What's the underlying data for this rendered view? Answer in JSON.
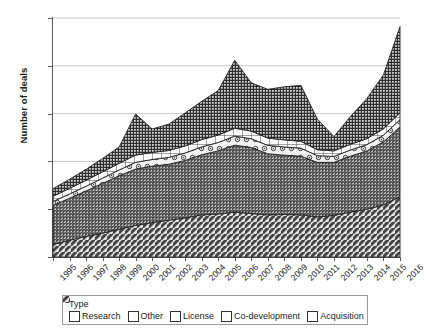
{
  "chart_data": {
    "type": "area",
    "stacked": true,
    "title": "",
    "xlabel": "",
    "ylabel": "Number of deals",
    "ylim": [
      0,
      2500
    ],
    "ytick_labels": [
      "0",
      "500",
      "1000",
      "1500",
      "2000",
      "2500"
    ],
    "ytick_values": [
      0,
      500,
      1000,
      1500,
      2000,
      2500
    ],
    "grid": true,
    "legend_title": "Type",
    "legend_position": "bottom",
    "categories": [
      "1995",
      "1996",
      "1997",
      "1998",
      "1999",
      "2000",
      "2001",
      "2002",
      "2003",
      "2004",
      "2005",
      "2006",
      "2007",
      "2008",
      "2009",
      "2010",
      "2011",
      "2012",
      "2013",
      "2014",
      "2015",
      "2016"
    ],
    "stack_order_bottom_to_top": [
      "Acquisition",
      "License",
      "Co-development",
      "Other",
      "Research"
    ],
    "series": [
      {
        "name": "Acquisition",
        "pattern": "diagonal-hatch-coarse",
        "values": [
          130,
          175,
          215,
          250,
          290,
          330,
          360,
          385,
          410,
          440,
          450,
          470,
          455,
          440,
          445,
          440,
          420,
          435,
          470,
          500,
          545,
          630
        ]
      },
      {
        "name": "License",
        "pattern": "diagonal-hatch-dense",
        "values": [
          410,
          440,
          475,
          520,
          560,
          590,
          590,
          585,
          600,
          630,
          660,
          700,
          690,
          640,
          620,
          615,
          570,
          555,
          585,
          610,
          660,
          730
        ]
      },
      {
        "name": "Co-development",
        "pattern": "circle-dots",
        "values": [
          40,
          45,
          50,
          55,
          60,
          70,
          70,
          72,
          78,
          82,
          88,
          95,
          92,
          88,
          86,
          84,
          70,
          62,
          64,
          66,
          70,
          78
        ]
      },
      {
        "name": "Other",
        "pattern": "open-grid",
        "values": [
          55,
          58,
          62,
          66,
          70,
          76,
          74,
          72,
          74,
          76,
          78,
          82,
          80,
          76,
          74,
          72,
          62,
          58,
          60,
          62,
          66,
          72
        ]
      },
      {
        "name": "Research",
        "pattern": "dense-dots-dark",
        "values": [
          80,
          95,
          115,
          140,
          170,
          430,
          245,
          275,
          345,
          400,
          465,
          710,
          505,
          510,
          555,
          585,
          320,
          150,
          290,
          420,
          565,
          900
        ]
      }
    ],
    "totals": [
      715,
      813,
      917,
      1031,
      1150,
      1496,
      1339,
      1389,
      1507,
      1628,
      1741,
      2057,
      1822,
      1754,
      1780,
      1796,
      1442,
      1260,
      1469,
      1658,
      1906,
      2410
    ]
  },
  "legend": {
    "title": "Type",
    "items": [
      {
        "label": "Research"
      },
      {
        "label": "Other"
      },
      {
        "label": "License"
      },
      {
        "label": "Co-development"
      },
      {
        "label": "Acquisition"
      }
    ]
  }
}
